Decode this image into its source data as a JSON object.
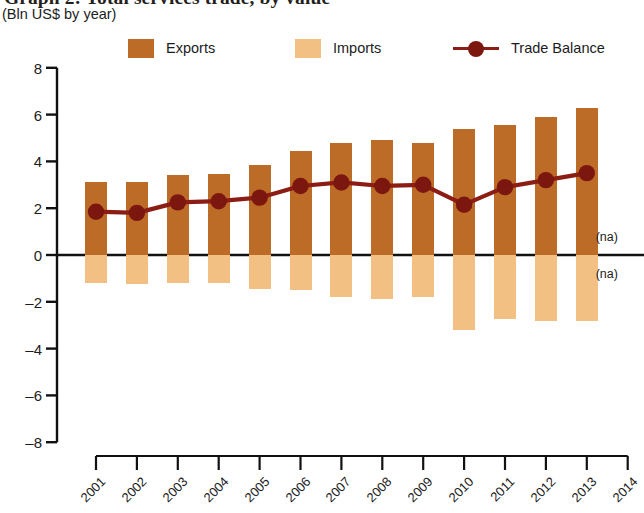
{
  "chart": {
    "title": "Graph 2: Total services trade, by value",
    "subtitle": "(Bln US$ by year)"
  },
  "legend": {
    "items": [
      {
        "label": "Exports",
        "type": "swatch",
        "color": "#bd6c28"
      },
      {
        "label": "Imports",
        "type": "swatch",
        "color": "#f2c083"
      },
      {
        "label": "Trade Balance",
        "type": "line",
        "color": "#8c1d14"
      }
    ]
  },
  "annotations": {
    "na_above": "(na)",
    "na_below": "(na)"
  },
  "chart_data": {
    "type": "bar",
    "title": "Graph 2: Total services trade, by value",
    "subtitle": "(Bln US$ by year)",
    "xlabel": "",
    "ylabel": "Bln US$",
    "ylim": [
      -8,
      8
    ],
    "yticks": [
      8,
      6,
      4,
      2,
      0,
      -2,
      -4,
      -6,
      -8
    ],
    "ytick_labels": [
      "8",
      "6",
      "4",
      "2",
      "0",
      "–2",
      "–4",
      "–6",
      "–8"
    ],
    "grid": false,
    "legend_position": "top",
    "categories": [
      "2001",
      "2002",
      "2003",
      "2004",
      "2005",
      "2006",
      "2007",
      "2008",
      "2009",
      "2010",
      "2011",
      "2012",
      "2013",
      "2014"
    ],
    "series": [
      {
        "name": "Exports",
        "type": "bar",
        "color": "#bd6c28",
        "values": [
          3.1,
          3.1,
          3.4,
          3.45,
          3.85,
          4.45,
          4.8,
          4.9,
          4.8,
          5.4,
          5.55,
          5.9,
          6.3,
          null
        ]
      },
      {
        "name": "Imports",
        "type": "bar",
        "color": "#f2c083",
        "values": [
          -1.2,
          -1.25,
          -1.2,
          -1.2,
          -1.45,
          -1.5,
          -1.8,
          -1.9,
          -1.8,
          -3.2,
          -2.75,
          -2.8,
          -2.8,
          null
        ]
      },
      {
        "name": "Trade Balance",
        "type": "line",
        "color": "#8c1d14",
        "values": [
          1.85,
          1.8,
          2.25,
          2.3,
          2.45,
          2.95,
          3.1,
          2.95,
          3.0,
          2.15,
          2.9,
          3.2,
          3.5,
          null
        ]
      }
    ]
  }
}
